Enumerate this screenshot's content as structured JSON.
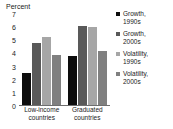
{
  "chart_data": {
    "type": "bar",
    "title": "",
    "subtitle": "",
    "xlabel": "",
    "ylabel": "Percent",
    "ylim": [
      0,
      7
    ],
    "yticks": [
      7,
      6,
      5,
      4,
      3,
      2,
      1,
      0
    ],
    "grid": false,
    "legend_position": "right",
    "categories": [
      "Low-income\ncountries",
      "Graduated\ncountries"
    ],
    "series": [
      {
        "name": "Growth,\n1990s",
        "values": [
          2.4,
          3.7
        ],
        "color": "#0d0d0d"
      },
      {
        "name": "Growth,\n2000s",
        "values": [
          4.7,
          6.0
        ],
        "color": "#595959"
      },
      {
        "name": "Volatility,\n1990s",
        "values": [
          5.2,
          5.9
        ],
        "color": "#a6a6a6"
      },
      {
        "name": "Volatility,\n2000s",
        "values": [
          3.8,
          4.1
        ],
        "color": "#808080"
      }
    ]
  }
}
